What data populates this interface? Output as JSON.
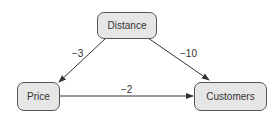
{
  "diagram": {
    "nodes": [
      {
        "id": "distance",
        "label": "Distance"
      },
      {
        "id": "price",
        "label": "Price"
      },
      {
        "id": "customers",
        "label": "Customers"
      }
    ],
    "edges": [
      {
        "from": "distance",
        "to": "price",
        "label": "−3"
      },
      {
        "from": "distance",
        "to": "customers",
        "label": "−10"
      },
      {
        "from": "price",
        "to": "customers",
        "label": "−2"
      }
    ],
    "colors": {
      "node_fill": "#e6e6e6",
      "node_border": "#555555",
      "edge": "#333333"
    }
  }
}
